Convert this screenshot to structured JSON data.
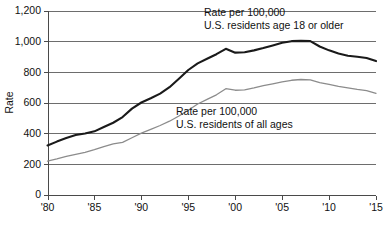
{
  "chart_data": {
    "type": "line",
    "title": "",
    "xlabel": "",
    "ylabel": "Rate",
    "xlim": [
      1980,
      2015
    ],
    "ylim": [
      0,
      1200
    ],
    "grid": true,
    "legend_position": "inline-annotation",
    "x_tick_labels": [
      "'80",
      "'85",
      "'90",
      "'95",
      "'00",
      "'05",
      "'10",
      "'15"
    ],
    "x_tick_values": [
      1980,
      1985,
      1990,
      1995,
      2000,
      2005,
      2010,
      2015
    ],
    "y_tick_labels": [
      "0",
      "200",
      "400",
      "600",
      "800",
      "1,000",
      "1,200"
    ],
    "y_tick_values": [
      0,
      200,
      400,
      600,
      800,
      1000,
      1200
    ],
    "x": [
      1980,
      1981,
      1982,
      1983,
      1984,
      1985,
      1986,
      1987,
      1988,
      1989,
      1990,
      1991,
      1992,
      1993,
      1994,
      1995,
      1996,
      1997,
      1998,
      1999,
      2000,
      2001,
      2002,
      2003,
      2004,
      2005,
      2006,
      2007,
      2008,
      2009,
      2010,
      2011,
      2012,
      2013,
      2014,
      2015
    ],
    "series": [
      {
        "name": "Rate per 100,000 U.S. residents age 18 or older",
        "color": "#1a1a1a",
        "width": 2.1,
        "values": [
          320,
          345,
          368,
          388,
          398,
          412,
          440,
          468,
          505,
          560,
          600,
          628,
          658,
          700,
          755,
          812,
          855,
          885,
          915,
          950,
          925,
          928,
          940,
          955,
          972,
          990,
          1000,
          1002,
          1000,
          965,
          940,
          920,
          905,
          898,
          890,
          870
        ]
      },
      {
        "name": "Rate per 100,000 U.S. residents of all ages",
        "color": "#8c8c8c",
        "width": 1.3,
        "values": [
          218,
          232,
          248,
          262,
          275,
          292,
          312,
          330,
          340,
          370,
          400,
          425,
          450,
          478,
          512,
          550,
          590,
          620,
          650,
          690,
          680,
          682,
          695,
          710,
          722,
          735,
          745,
          750,
          748,
          730,
          718,
          705,
          695,
          685,
          678,
          660
        ]
      }
    ],
    "annotations": [
      {
        "id": "annotation-adults",
        "lines": [
          "Rate per 100,000",
          "U.S. residents age 18 or older"
        ],
        "x": 204,
        "y": 16
      },
      {
        "id": "annotation-all-ages",
        "lines": [
          "Rate per 100,000",
          "U.S. residents of all ages"
        ],
        "x": 176,
        "y": 115
      }
    ]
  }
}
